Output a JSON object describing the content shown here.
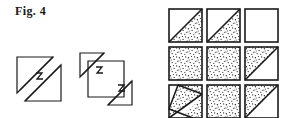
{
  "figure": {
    "label": "Fig. 4",
    "caption_position": "top-left"
  },
  "colors": {
    "stroke": "#1a1a1a",
    "background": "#ffffff",
    "stipple": "#2b2b2b"
  },
  "left_panel": {
    "name": "cut-shapes-group",
    "shapes": [
      {
        "id": "shape-a",
        "name": "square-two-piece-diagonal-cut",
        "description": "Square divided by an offset diagonal cut into an upper-left triangle and a lower-right triangle, joined by a small zigzag notch at the center",
        "pieces": 2,
        "zigzag_marks": 1
      },
      {
        "id": "shape-b",
        "name": "square-three-piece-diagonal-cut",
        "description": "Square divided by two offset diagonal cuts into an upper-left triangle, a central hexagonal band, and a lower-right triangle, each joined by a small zigzag notch",
        "pieces": 3,
        "zigzag_marks": 2
      }
    ]
  },
  "right_panel": {
    "name": "pattern-grid",
    "rows": 3,
    "cols": 3,
    "cells": [
      {
        "id": "cell-r1c1",
        "fill": "lower-right-triangle",
        "diagonal": "bl-tr"
      },
      {
        "id": "cell-r1c2",
        "fill": "lower-right-triangle",
        "diagonal": "bl-tr"
      },
      {
        "id": "cell-r1c3",
        "fill": "none",
        "diagonal": "none"
      },
      {
        "id": "cell-r2c1",
        "fill": "full",
        "diagonal": "none"
      },
      {
        "id": "cell-r2c2",
        "fill": "full",
        "diagonal": "none"
      },
      {
        "id": "cell-r2c3",
        "fill": "upper-left-triangle",
        "diagonal": "bl-tr"
      },
      {
        "id": "cell-r3c1",
        "fill": "diagonal-band",
        "diagonal": "band-bl-tr"
      },
      {
        "id": "cell-r3c2",
        "fill": "full",
        "diagonal": "none"
      },
      {
        "id": "cell-r3c3",
        "fill": "upper-left-triangle",
        "diagonal": "bl-tr"
      }
    ]
  }
}
